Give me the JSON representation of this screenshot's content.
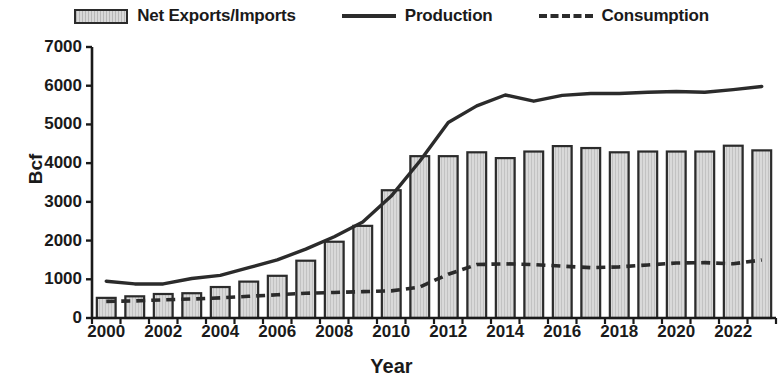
{
  "legend": {
    "items": [
      {
        "label": "Net Exports/Imports",
        "marker": "bar-swatch-icon"
      },
      {
        "label": "Production",
        "marker": "solid-line-icon"
      },
      {
        "label": "Consumption",
        "marker": "dashed-line-icon"
      }
    ]
  },
  "axes": {
    "ylabel": "Bcf",
    "xlabel": "Year",
    "yticks": [
      "0",
      "1000",
      "2000",
      "3000",
      "4000",
      "5000",
      "6000",
      "7000"
    ],
    "xticks": [
      "2000",
      "2002",
      "2004",
      "2006",
      "2008",
      "2010",
      "2012",
      "2014",
      "2016",
      "2018",
      "2020",
      "2022"
    ]
  },
  "colors": {
    "bar_fill": "#d9d9d9",
    "bar_stroke": "#2b2b2b",
    "line": "#2b2b2b",
    "axis": "#1a1a1a",
    "background": "#ffffff"
  },
  "chart_data": {
    "type": "bar",
    "title": "",
    "subtitle": "",
    "xlabel": "Year",
    "ylabel": "Bcf",
    "ylim": [
      0,
      7000
    ],
    "ytick_step": 1000,
    "xlim": [
      1999.5,
      2023.5
    ],
    "grid": false,
    "legend_position": "top",
    "x": [
      2000,
      2001,
      2002,
      2003,
      2004,
      2005,
      2006,
      2007,
      2008,
      2009,
      2010,
      2011,
      2012,
      2013,
      2014,
      2015,
      2016,
      2017,
      2018,
      2019,
      2020,
      2021,
      2022,
      2023
    ],
    "categories": [
      "2000",
      "2001",
      "2002",
      "2003",
      "2004",
      "2005",
      "2006",
      "2007",
      "2008",
      "2009",
      "2010",
      "2011",
      "2012",
      "2013",
      "2014",
      "2015",
      "2016",
      "2017",
      "2018",
      "2019",
      "2020",
      "2021",
      "2022",
      "2023"
    ],
    "series": [
      {
        "name": "Net Exports/Imports",
        "type": "bar",
        "values": [
          520,
          560,
          620,
          640,
          800,
          940,
          1090,
          1480,
          1970,
          2380,
          3300,
          4180,
          4180,
          4280,
          4130,
          4300,
          4440,
          4390,
          4280,
          4300,
          4300,
          4300,
          4450,
          4330
        ]
      },
      {
        "name": "Production",
        "type": "line",
        "style": "solid",
        "values": [
          950,
          880,
          880,
          1020,
          1100,
          1300,
          1500,
          1780,
          2100,
          2480,
          3150,
          4050,
          5050,
          5480,
          5760,
          5600,
          5750,
          5800,
          5800,
          5830,
          5850,
          5830,
          5900,
          5980
        ]
      },
      {
        "name": "Consumption",
        "type": "line",
        "style": "dashed",
        "values": [
          430,
          440,
          470,
          490,
          520,
          560,
          600,
          640,
          660,
          680,
          700,
          800,
          1130,
          1380,
          1400,
          1380,
          1340,
          1300,
          1320,
          1370,
          1420,
          1430,
          1400,
          1500
        ]
      }
    ]
  }
}
